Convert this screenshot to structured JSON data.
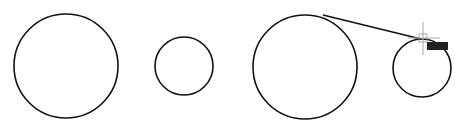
{
  "drawing": {
    "stroke_color": "#111111",
    "background_color": "#ffffff",
    "entities": [
      {
        "type": "circle",
        "name": "circle-1"
      },
      {
        "type": "circle",
        "name": "circle-2"
      },
      {
        "type": "circle",
        "name": "circle-3"
      },
      {
        "type": "circle",
        "name": "circle-4"
      },
      {
        "type": "line",
        "name": "tangent-line"
      }
    ]
  },
  "cursor": {
    "type": "crosshair",
    "color": "#999999"
  },
  "snap_tooltip": {
    "label": "",
    "color": "#222222"
  }
}
